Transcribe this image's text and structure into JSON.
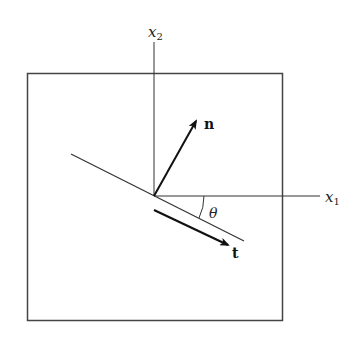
{
  "diagram": {
    "title": "",
    "labels": {
      "x2_base": "x",
      "x2_sub": "2",
      "x1_base": "x",
      "x1_sub": "1",
      "normal": "n",
      "tangent": "t",
      "angle": "θ"
    },
    "colors": {
      "line": "#333333",
      "arrow": "#111111",
      "background": "#ffffff"
    }
  }
}
